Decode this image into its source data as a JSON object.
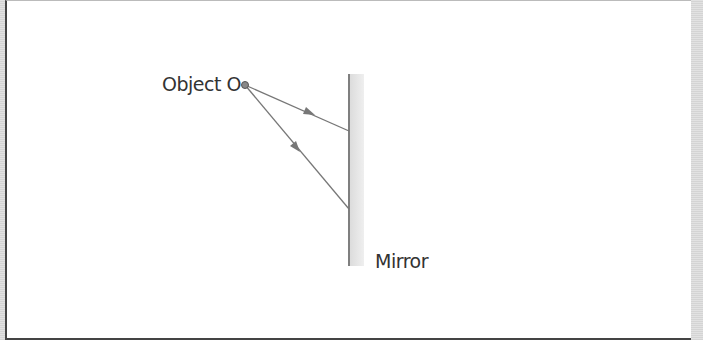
{
  "diagram": {
    "object_label": "Object O",
    "mirror_label": "Mirror",
    "colors": {
      "ray": "#777777",
      "mirror_line": "#555555",
      "mirror_shade": "#e6e6e6",
      "object_dot": "#888888"
    },
    "object_point": [
      245,
      85
    ],
    "rays": [
      {
        "from": [
          245,
          85
        ],
        "to": [
          349,
          131
        ]
      },
      {
        "from": [
          245,
          85
        ],
        "to": [
          349,
          209
        ]
      }
    ]
  }
}
